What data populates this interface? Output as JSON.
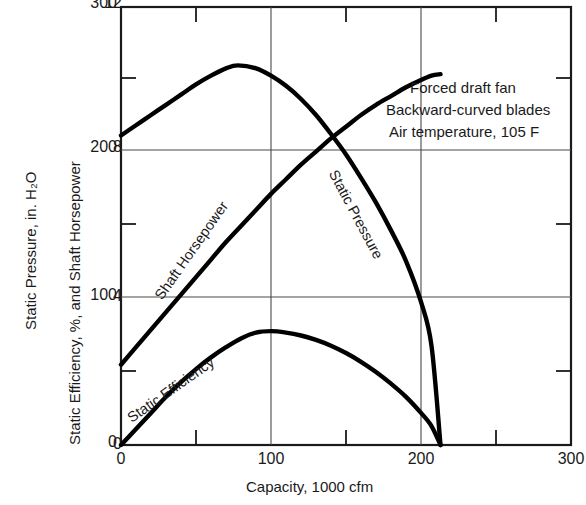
{
  "chart_data": {
    "type": "line",
    "title": "",
    "xlabel": "Capacity, 1000 cfm",
    "ylabel_primary": "Static Pressure, in. H₂O",
    "ylabel_secondary": "Static Efficiency, %, and Shaft Horsepower",
    "xlim": [
      0,
      300
    ],
    "ylim_primary": [
      0,
      12
    ],
    "ylim_secondary": [
      0,
      300
    ],
    "xticks": [
      0,
      100,
      200,
      300
    ],
    "xticks_minor": [
      50,
      150,
      250
    ],
    "yticks_primary": [
      0,
      4,
      8,
      12
    ],
    "yticks_secondary": [
      0,
      100,
      200,
      300
    ],
    "yticks_secondary_minor": [
      50,
      150,
      250
    ],
    "grid": true,
    "legend_position": "inline-curve-labels",
    "annotations": [
      "Forced draft fan",
      "Backward-curved blades",
      "Air temperature, 105 F"
    ],
    "series": [
      {
        "name": "Static Pressure",
        "axis": "secondary",
        "x": [
          0,
          10,
          20,
          30,
          40,
          50,
          60,
          70,
          78,
          90,
          100,
          110,
          120,
          130,
          140,
          150,
          160,
          170,
          180,
          190,
          200,
          207,
          213
        ],
        "values": [
          212,
          219,
          226,
          233,
          240,
          247,
          253,
          258,
          260,
          258,
          253,
          246,
          237,
          226,
          213,
          199,
          183,
          166,
          147,
          126,
          98,
          68,
          0
        ]
      },
      {
        "name": "Shaft Horsepower",
        "axis": "secondary",
        "x": [
          0,
          10,
          20,
          30,
          40,
          50,
          60,
          70,
          80,
          90,
          100,
          110,
          120,
          130,
          140,
          150,
          160,
          170,
          180,
          190,
          200,
          207,
          213
        ],
        "values": [
          55,
          67,
          79,
          91,
          103,
          115,
          127,
          139,
          150,
          161,
          172,
          182,
          192,
          201,
          210,
          218,
          226,
          233,
          239,
          245,
          250,
          253,
          254
        ]
      },
      {
        "name": "Static Efficiency",
        "axis": "secondary",
        "x": [
          0,
          10,
          20,
          30,
          40,
          50,
          60,
          70,
          80,
          90,
          100,
          110,
          120,
          130,
          140,
          150,
          160,
          170,
          180,
          190,
          200,
          207,
          213
        ],
        "values": [
          0,
          11,
          22,
          33,
          43,
          52,
          60,
          67,
          73,
          77,
          78,
          77,
          75,
          72,
          68,
          63,
          57,
          50,
          42,
          33,
          22,
          13,
          0
        ]
      }
    ]
  },
  "axes": {
    "x": {
      "label": "Capacity, 1000 cfm",
      "ticks": [
        "0",
        "100",
        "200",
        "300"
      ]
    },
    "y_primary": {
      "label": "Static Pressure, in. H₂O",
      "ticks": [
        "0",
        "4",
        "8",
        "12"
      ]
    },
    "y_secondary": {
      "label": "Static Efficiency, %, and Shaft Horsepower",
      "ticks": [
        "0",
        "100",
        "200",
        "300"
      ]
    }
  },
  "curve_labels": {
    "static_pressure": "Static Pressure",
    "shaft_horsepower": "Shaft Horsepower",
    "static_efficiency": "Static Efficiency"
  },
  "annotation": {
    "line1": "Forced draft fan",
    "line2": "Backward-curved blades",
    "line3": "Air temperature, 105 F"
  },
  "colors": {
    "curve": "#000000",
    "axis": "#1a1a1a",
    "grid": "#4a4a4a",
    "background": "#ffffff"
  }
}
